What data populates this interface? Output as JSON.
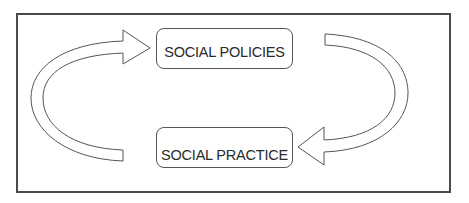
{
  "diagram": {
    "type": "cycle",
    "nodes": [
      {
        "id": "policies",
        "label": "SOCIAL POLICIES"
      },
      {
        "id": "practice",
        "label": "SOCIAL PRACTICE"
      }
    ],
    "edges": [
      {
        "from": "policies",
        "to": "practice",
        "side": "right",
        "shape": "curved-arrow"
      },
      {
        "from": "practice",
        "to": "policies",
        "side": "left",
        "shape": "curved-arrow"
      }
    ],
    "colors": {
      "stroke": "#555555",
      "frame": "#4a4a4a",
      "fill": "#ffffff",
      "text": "#2a2a2a"
    }
  }
}
